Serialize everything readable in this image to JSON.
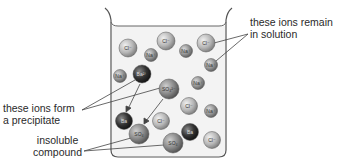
{
  "labels": {
    "remain": [
      "these ions remain",
      "in solution"
    ],
    "precipitate": [
      "these ions form",
      "a precipitate"
    ],
    "insoluble": [
      "insoluble",
      "compound"
    ]
  },
  "ions": [
    {
      "id": "cl-1",
      "label": "Cl⁻",
      "type": "cl",
      "cx": 128,
      "cy": 48,
      "r": 9
    },
    {
      "id": "cl-2",
      "label": "Cl⁻",
      "type": "cl",
      "cx": 166,
      "cy": 41,
      "r": 9
    },
    {
      "id": "cl-3",
      "label": "Cl⁻",
      "type": "cl",
      "cx": 206,
      "cy": 43,
      "r": 9
    },
    {
      "id": "na-1",
      "label": "Na⁺",
      "type": "na",
      "cx": 151,
      "cy": 55,
      "r": 6.5
    },
    {
      "id": "na-2",
      "label": "Na⁺",
      "type": "na",
      "cx": 186,
      "cy": 51,
      "r": 6.5
    },
    {
      "id": "na-3",
      "label": "Na⁺",
      "type": "na",
      "cx": 211,
      "cy": 65,
      "r": 6.5
    },
    {
      "id": "na-4",
      "label": "Na⁺",
      "type": "na",
      "cx": 120,
      "cy": 76,
      "r": 6.5
    },
    {
      "id": "na-5",
      "label": "Na⁺",
      "type": "na",
      "cx": 198,
      "cy": 83,
      "r": 6.5
    },
    {
      "id": "ba-1",
      "label": "Ba²⁺",
      "type": "ba",
      "cx": 142,
      "cy": 74,
      "r": 9
    },
    {
      "id": "so4-1",
      "label": "SO₄²⁻",
      "type": "so4",
      "cx": 169,
      "cy": 89,
      "r": 10
    },
    {
      "id": "cl-4",
      "label": "Cl⁻",
      "type": "cl",
      "cx": 189,
      "cy": 106,
      "r": 8.5
    },
    {
      "id": "na-6",
      "label": "Na⁺",
      "type": "na",
      "cx": 211,
      "cy": 111,
      "r": 6.5
    },
    {
      "id": "cl-5",
      "label": "Cl⁻",
      "type": "cl",
      "cx": 161,
      "cy": 121,
      "r": 8.5
    },
    {
      "id": "ba-2",
      "label": "Ba",
      "type": "ba",
      "cx": 124,
      "cy": 121,
      "r": 8.5
    },
    {
      "id": "so4-2",
      "label": "SO₄",
      "type": "so4",
      "cx": 139,
      "cy": 134,
      "r": 10
    },
    {
      "id": "ba-3",
      "label": "Ba",
      "type": "ba",
      "cx": 190,
      "cy": 132,
      "r": 8.5
    },
    {
      "id": "so4-3",
      "label": "SO₄",
      "type": "so4",
      "cx": 173,
      "cy": 143,
      "r": 10
    },
    {
      "id": "cl-6",
      "label": "Cl⁻",
      "type": "cl",
      "cx": 212,
      "cy": 140,
      "r": 8.5
    }
  ],
  "colors": {
    "cl": "#b9b9b9",
    "na": "#9a9a9a",
    "ba": "#3c3c3c",
    "so4": "#8a8a8a",
    "beaker_stroke": "#555555",
    "water": "#f2f2f2"
  }
}
